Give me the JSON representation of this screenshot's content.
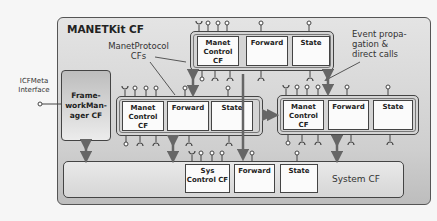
{
  "title": "MANETKit CF",
  "external": {
    "icf_meta_interface": "ICFMeta\nInterface"
  },
  "framework_manager": {
    "label": "Frame-\nworkMan-\nager CF"
  },
  "annotations": {
    "manet_protocol_cfs": "ManetProtocol\nCFs",
    "event_propagation": "Event propa-\ngation &\ndirect calls"
  },
  "protocol_cfs": [
    {
      "id": "top",
      "components": [
        "Manet\nControl\nCF",
        "Forward",
        "State"
      ]
    },
    {
      "id": "left",
      "components": [
        "Manet\nControl\nCF",
        "Forward",
        "State"
      ]
    },
    {
      "id": "right",
      "components": [
        "Manet\nControl\nCF",
        "Forward",
        "State"
      ]
    }
  ],
  "system_cf": {
    "label": "System CF",
    "components": [
      "Sys\nControl CF",
      "Forward",
      "State"
    ]
  },
  "colors": {
    "frame": "#cfcfcf",
    "component": "#fbfbfb",
    "stroke": "#444444",
    "arrow": "#666666"
  }
}
